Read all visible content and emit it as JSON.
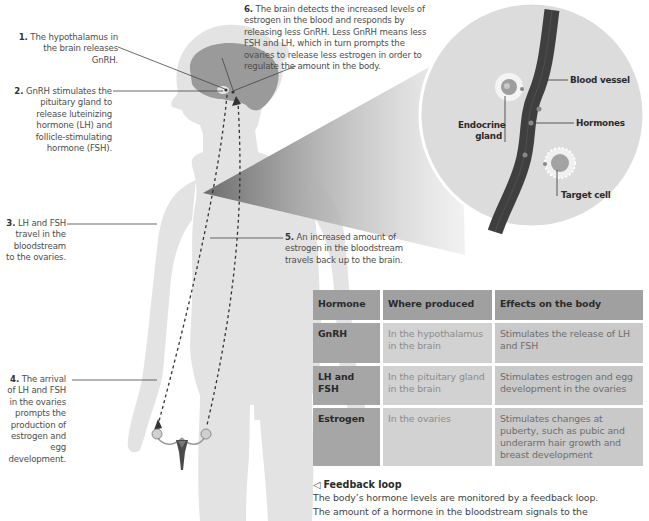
{
  "callouts": {
    "c1": {
      "num": "1.",
      "text": "The hypothalamus in the brain releases GnRH."
    },
    "c2": {
      "num": "2.",
      "text": "GnRH stimulates the pituitary gland to release luteinizing hormone (LH) and follicle-stimulating hormone (FSH)."
    },
    "c3": {
      "num": "3.",
      "text": "LH and FSH travel in the bloodstream to the ovaries."
    },
    "c4": {
      "num": "4.",
      "text": "The arrival of LH and FSH in the ovaries prompts the production of estrogen and egg development."
    },
    "c5": {
      "num": "5.",
      "text": "An increased amount of estrogen in the bloodstream travels back up to the brain."
    },
    "c6": {
      "num": "6.",
      "text": "The brain detects the increased levels of estrogen in the blood and responds by releasing less GnRH. Less GnRH means less FSH and LH, which in turn prompts the ovaries to release less estrogen in order to regulate the amount in the body."
    }
  },
  "inset": {
    "labels": {
      "blood_vessel": "Blood vessel",
      "endocrine_gland": "Endocrine gland",
      "hormones": "Hormones",
      "target_cell": "Target cell"
    }
  },
  "table": {
    "headers": [
      "Hormone",
      "Where produced",
      "Effects on the body"
    ],
    "rows": [
      {
        "hormone": "GnRH",
        "where": "In the hypothalamus in the brain",
        "effects": "Stimulates the release of LH and FSH"
      },
      {
        "hormone": "LH and FSH",
        "where": "In the pituitary gland in the brain",
        "effects": "Stimulates estrogen and egg development in the ovaries"
      },
      {
        "hormone": "Estrogen",
        "where": "In the ovaries",
        "effects": "Stimulates changes at puberty, such as pubic and underarm hair growth and breast development"
      }
    ]
  },
  "feedback": {
    "icon": "left-triangle-pointer-icon",
    "title": "Feedback loop",
    "body_line1": "The body’s hormone levels are monitored by a feedback loop.",
    "body_line2": "The amount of a hormone in the bloodstream signals to the"
  },
  "colors": {
    "body_silhouette": "#e3e3e3",
    "brain": "#9a9a9a",
    "vessel": "#3f3f3f",
    "inset_circle": "#dcdcdc",
    "table_header": "#a0a0a0"
  }
}
